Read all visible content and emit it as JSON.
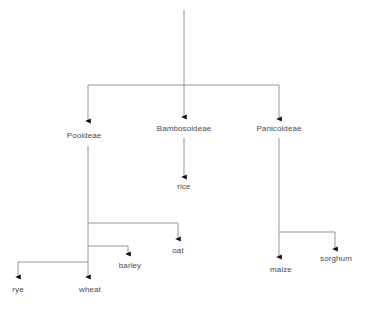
{
  "diagram": {
    "type": "tree-diagram",
    "stroke_color": "#808080",
    "arrow_color": "#1a1a1a",
    "text_color": "#4a4a4a",
    "background_color": "#ffffff",
    "root": {
      "label": "",
      "x": 184,
      "y_start": 10,
      "y_end": 85
    },
    "nodes": [
      {
        "id": "pooideae",
        "label": "Pooideae",
        "level": "subfamily",
        "x": 88,
        "label_x": 84,
        "label_y": 131,
        "arrow_y": 122
      },
      {
        "id": "bambosoideae",
        "label": "Bambosoideae",
        "level": "subfamily",
        "x": 184,
        "label_x": 184,
        "label_y": 124,
        "arrow_y": 118
      },
      {
        "id": "panicoideae",
        "label": "Panicoideae",
        "level": "subfamily",
        "x": 279,
        "label_x": 279,
        "label_y": 124,
        "arrow_y": 120
      },
      {
        "id": "rice",
        "label": "rice",
        "level": "crop",
        "parent": "bambosoideae",
        "x": 184,
        "label_x": 184,
        "label_y": 182,
        "arrow_y": 178
      },
      {
        "id": "oat",
        "label": "oat",
        "level": "crop",
        "parent": "pooideae",
        "x": 178,
        "label_x": 178,
        "label_y": 246,
        "arrow_y": 240,
        "branch_y": 223
      },
      {
        "id": "barley",
        "label": "barley",
        "level": "crop",
        "parent": "pooideae",
        "x": 128,
        "label_x": 130,
        "label_y": 261,
        "arrow_y": 255,
        "branch_y": 246
      },
      {
        "id": "rye",
        "label": "rye",
        "level": "crop",
        "parent": "pooideae",
        "x": 18,
        "label_x": 18,
        "label_y": 285,
        "arrow_y": 278,
        "branch_y": 262
      },
      {
        "id": "wheat",
        "label": "wheat",
        "level": "crop",
        "parent": "pooideae",
        "x": 88,
        "label_x": 90,
        "label_y": 285,
        "arrow_y": 278
      },
      {
        "id": "maize",
        "label": "maize",
        "level": "crop",
        "parent": "panicoideae",
        "x": 279,
        "label_x": 281,
        "label_y": 265,
        "arrow_y": 258
      },
      {
        "id": "sorghum",
        "label": "sorghum",
        "level": "crop",
        "parent": "panicoideae",
        "x": 335,
        "label_x": 336,
        "label_y": 254,
        "arrow_y": 250,
        "branch_y": 232
      }
    ]
  }
}
